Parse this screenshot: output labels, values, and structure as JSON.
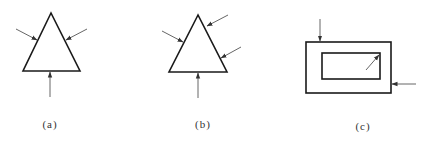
{
  "figure": {
    "panels": [
      {
        "id": "a",
        "label": "(a)",
        "shape": "triangle",
        "arrows": 3
      },
      {
        "id": "b",
        "label": "(b)",
        "shape": "triangle",
        "arrows": 4
      },
      {
        "id": "c",
        "label": "(c)",
        "shape": "rectangle-with-inner-rectangle",
        "arrows": 3
      }
    ]
  },
  "colors": {
    "stroke": "#1a1a1a",
    "arrow": "#555555",
    "background": "#ffffff"
  }
}
